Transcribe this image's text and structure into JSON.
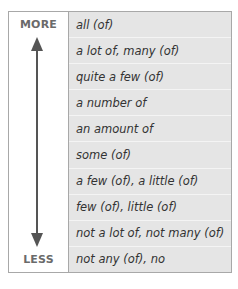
{
  "scale": {
    "top_label": "MORE",
    "bottom_label": "LESS",
    "arrow_color": "#555555"
  },
  "quantifiers": [
    "all (of)",
    "a lot of, many (of)",
    "quite a few (of)",
    "a number of",
    "an amount of",
    "some (of)",
    "a few (of), a little (of)",
    "few (of), little (of)",
    "not a lot of, not many (of)",
    "not any (of), no"
  ],
  "colors": {
    "border": "#a8a8a8",
    "list_background": "#e5e5e5",
    "text": "#333333",
    "scale_text": "#6a6a6a"
  }
}
